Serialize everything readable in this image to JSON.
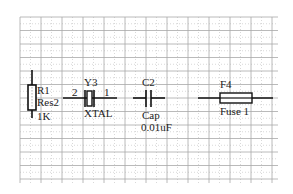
{
  "schematic": {
    "grid": {
      "x0": 20,
      "y0": 17,
      "x1": 278,
      "y1": 183,
      "major_dx": 21,
      "major_dy": 13.5,
      "major_color": "#a8a8a8",
      "minor_color": "#cfcfcf"
    },
    "components": [
      {
        "id": "r1",
        "type": "resistor",
        "designator": "R1",
        "comment": "Res2",
        "value": "1K"
      },
      {
        "id": "y3",
        "type": "crystal",
        "designator": "Y3",
        "comment": "XTAL",
        "pin_left": "2",
        "pin_right": "1"
      },
      {
        "id": "c2",
        "type": "capacitor",
        "designator": "C2",
        "comment": "Cap",
        "value": "0.01uF"
      },
      {
        "id": "f4",
        "type": "fuse",
        "designator": "F4",
        "comment": "Fuse 1"
      }
    ],
    "wire_color": "#111111"
  }
}
